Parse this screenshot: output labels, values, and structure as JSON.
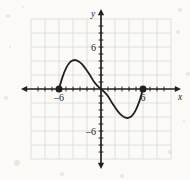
{
  "figure": {
    "name": "cubic-function-graph",
    "background_color": "#fbfaf7",
    "grid_color": "#d8d8d8",
    "axis_color": "#231f20",
    "curve_color": "#231f20",
    "point_color": "#231f20"
  },
  "axes": {
    "x_axis_label": "x",
    "y_axis_label": "y",
    "x_tick_labels": [
      {
        "value": -6,
        "text": "–6"
      },
      {
        "value": 6,
        "text": "6"
      }
    ],
    "y_tick_labels": [
      {
        "value": 6,
        "text": "6"
      },
      {
        "value": -6,
        "text": "–6"
      }
    ]
  },
  "chart_data": {
    "type": "line",
    "title": "",
    "subtitle": "",
    "xlabel": "x",
    "ylabel": "y",
    "xlim": [
      -10,
      10
    ],
    "ylim": [
      -10,
      10
    ],
    "grid": true,
    "grid_step": 2,
    "tick_step": 1,
    "legend": null,
    "annotations": [],
    "series": [
      {
        "name": "curve",
        "kind": "cubic",
        "x": [
          -6,
          -5.5,
          -5,
          -4.5,
          -4,
          -3.5,
          -3,
          -2.5,
          -2,
          -1.5,
          -1,
          -0.5,
          0,
          0.5,
          1,
          1.5,
          2,
          2.5,
          3,
          3.5,
          4,
          4.5,
          5,
          5.5,
          6
        ],
        "y": [
          0,
          1.7,
          2.95,
          3.75,
          4.1,
          4.1,
          3.8,
          3.3,
          2.6,
          1.85,
          1.05,
          0.45,
          0,
          -0.45,
          -1.05,
          -1.85,
          -2.6,
          -3.3,
          -3.8,
          -4.1,
          -4.1,
          -3.75,
          -2.95,
          -1.7,
          0
        ]
      }
    ],
    "endpoints": [
      {
        "label": "left-endpoint",
        "x": -6,
        "y": 0,
        "filled": true
      },
      {
        "label": "right-endpoint",
        "x": 6,
        "y": 0,
        "filled": true
      }
    ],
    "roots": [
      -6,
      0,
      6
    ],
    "local_max": {
      "x": -3.7,
      "y": 4.1
    },
    "local_min": {
      "x": 3.7,
      "y": -4.1
    }
  }
}
